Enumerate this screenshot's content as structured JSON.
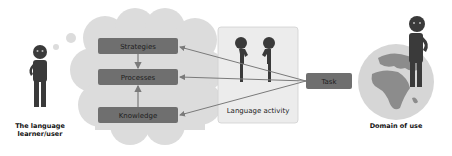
{
  "diagram": {
    "learner_label_line1": "The language",
    "learner_label_line2": "learner/user",
    "thought_boxes": [
      {
        "label": "Strategies"
      },
      {
        "label": "Processes"
      },
      {
        "label": "Knowledge"
      }
    ],
    "activity_label": "Language activity",
    "task_label": "Task",
    "domain_label": "Domain of use",
    "icons": {
      "learner": "person-icon",
      "thought_cloud": "thought-cloud-icon",
      "speakers": "two-people-talking-icon",
      "globe": "globe-icon",
      "domain_person": "person-icon"
    },
    "colors": {
      "box_fill": "#6f6f6f",
      "cloud_fill": "#dcdcdc",
      "activity_fill": "#ececec",
      "figure_fill": "#3a3a3a",
      "arrow": "#7a7a7a"
    }
  }
}
